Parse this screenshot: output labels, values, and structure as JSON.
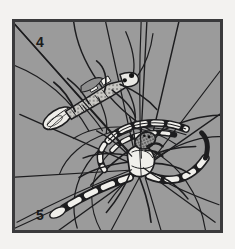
{
  "figure": {
    "style": "halftone line illustration",
    "background_color": "#f3f2f0",
    "panel_background_color": "#9b9b9b",
    "frame_color": "#3a3a3c",
    "ink_color": "#1b1b1b",
    "highlight_color": "#f2f2ee"
  },
  "panels": [
    {
      "number": "4",
      "position": "top-left",
      "subject": "insect wrapped in silk on web"
    },
    {
      "number": "5",
      "position": "bottom-left",
      "subject": "banded spider on web"
    }
  ],
  "labels": {
    "panel_4": "4",
    "panel_5": "5"
  }
}
